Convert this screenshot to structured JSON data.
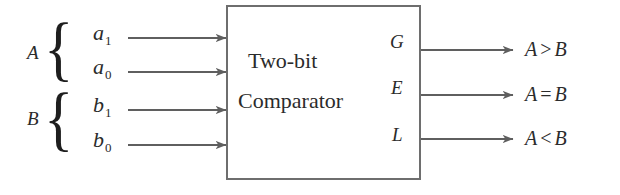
{
  "diagram": {
    "background_color": "#ffffff",
    "line_color": "#6e6e6e",
    "text_color": "#2b2b2b"
  },
  "block": {
    "line1": "Two-bit",
    "line2": "Comparator",
    "border_color": "#6e6e6e"
  },
  "input_groups": [
    {
      "label": "A",
      "brace": "{"
    },
    {
      "label": "B",
      "brace": "{"
    }
  ],
  "inputs": [
    {
      "name": "a",
      "sub": "1",
      "group": "A"
    },
    {
      "name": "a",
      "sub": "0",
      "group": "A"
    },
    {
      "name": "b",
      "sub": "1",
      "group": "B"
    },
    {
      "name": "b",
      "sub": "0",
      "group": "B"
    }
  ],
  "output_ports": [
    {
      "label": "G"
    },
    {
      "label": "E"
    },
    {
      "label": "L"
    }
  ],
  "outputs": [
    {
      "left": "A",
      "op": ">",
      "right": "B"
    },
    {
      "left": "A",
      "op": "=",
      "right": "B"
    },
    {
      "left": "A",
      "op": "<",
      "right": "B"
    }
  ]
}
